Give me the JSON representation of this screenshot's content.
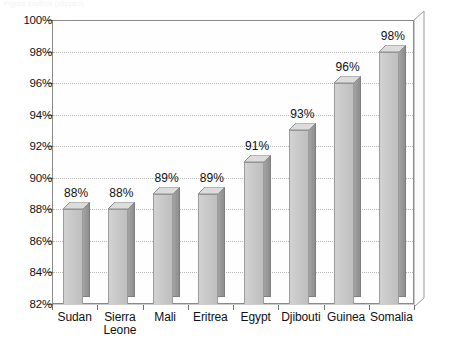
{
  "chart_data": {
    "type": "bar",
    "title": "",
    "subtitle": "",
    "xlabel": "",
    "ylabel": "",
    "categories": [
      "Sudan",
      "Sierra Leone",
      "Mali",
      "Eritrea",
      "Egypt",
      "Djibouti",
      "Guinea",
      "Somalia"
    ],
    "values": [
      88,
      88,
      89,
      89,
      91,
      93,
      96,
      98
    ],
    "value_labels": [
      "88%",
      "88%",
      "89%",
      "89%",
      "91%",
      "93%",
      "96%",
      "98%"
    ],
    "ylim": [
      82,
      100
    ],
    "ytick_values": [
      82,
      84,
      86,
      88,
      90,
      92,
      94,
      96,
      98,
      100
    ],
    "ytick_labels": [
      "82%",
      "84%",
      "86%",
      "88%",
      "90%",
      "92%",
      "94%",
      "96%",
      "98%",
      "100%"
    ],
    "grid": true,
    "grid_style": "dotted-horizontal",
    "legend": false,
    "legend_position": "none",
    "style": "3d-column",
    "bar_face_color": "#c9c9c9",
    "bar_side_color": "#959595",
    "bar_edge_color": "#8e8e8e",
    "grid_color": "#b9b9b9",
    "axis_color": "#8a8a8a",
    "text_color": "#111111",
    "background_color": "#ffffff"
  },
  "artifacts": {
    "top_clipped_text": "Figure caption (clipped)"
  }
}
